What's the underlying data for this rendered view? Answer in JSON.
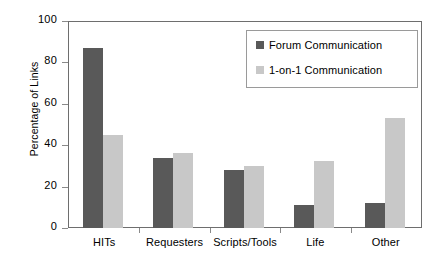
{
  "chart_data": {
    "type": "bar",
    "title": "",
    "xlabel": "",
    "ylabel": "Percentage of Links",
    "categories": [
      "HITs",
      "Requesters",
      "Scripts/Tools",
      "Life",
      "Other"
    ],
    "series": [
      {
        "name": "Forum Communication",
        "color": "#595959",
        "values": [
          87,
          34,
          28,
          11,
          12
        ]
      },
      {
        "name": "1-on-1 Communication",
        "color": "#c8c8c8",
        "values": [
          45,
          36,
          30,
          32.5,
          53
        ]
      }
    ],
    "ylim": [
      0,
      100
    ],
    "yticks": [
      0,
      20,
      40,
      60,
      80,
      100
    ],
    "ytick_labels": [
      "0",
      "20",
      "40",
      "60",
      "80",
      "100"
    ],
    "grid": false,
    "legend_position": "top-right",
    "frame": true
  }
}
